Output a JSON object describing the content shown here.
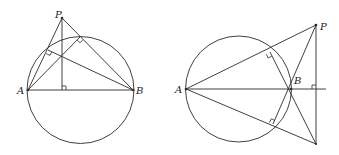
{
  "figures": [
    {
      "id": "left",
      "labels": {
        "P": "P",
        "A": "A",
        "B": "B"
      },
      "circle": {
        "cx": 80.5,
        "cy": 90,
        "r": 53.5
      }
    },
    {
      "id": "right",
      "labels": {
        "P": "P",
        "A": "A",
        "B": "B"
      },
      "circle": {
        "cx": 238.5,
        "cy": 89,
        "r": 53
      }
    }
  ]
}
